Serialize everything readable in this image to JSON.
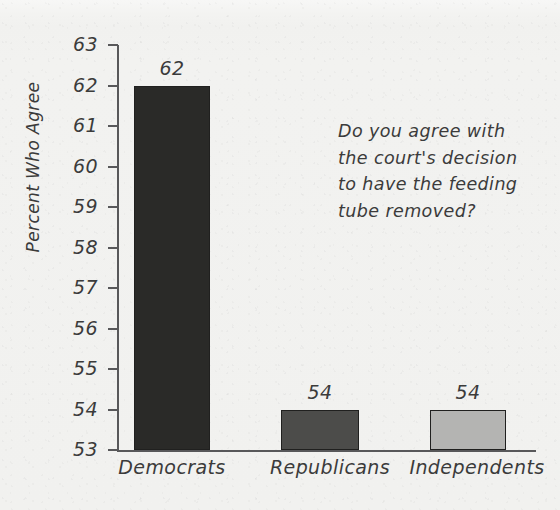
{
  "chart_data": {
    "type": "bar",
    "title": "",
    "subtitle": "",
    "xlabel": "",
    "ylabel": "Percent Who Agree",
    "categories": [
      "Democrats",
      "Republicans",
      "Independents"
    ],
    "values": [
      62,
      54,
      54
    ],
    "value_labels": [
      "62",
      "54",
      "54"
    ],
    "bar_colors": [
      "#2a2a28",
      "#4c4c4a",
      "#b4b4b2"
    ],
    "ylim": [
      53,
      63
    ],
    "yticks": [
      63,
      62,
      61,
      60,
      59,
      58,
      57,
      56,
      55,
      54,
      53
    ],
    "ytick_labels": [
      "63",
      "62",
      "61",
      "60",
      "59",
      "58",
      "57",
      "56",
      "55",
      "54",
      "53"
    ],
    "grid": false,
    "legend": "none",
    "annotations": [
      {
        "text": "Do you agree with the court's decision to have the feeding tube removed?",
        "position": "upper-right"
      }
    ]
  },
  "annotation": {
    "line1": "Do you agree with",
    "line2": "the court's decision",
    "line3": "to have the feeding",
    "line4": "tube removed?"
  },
  "colors": {
    "paper_background": "#f2f2f0",
    "axis": "#58585a",
    "ink": "#3b3b3b"
  }
}
